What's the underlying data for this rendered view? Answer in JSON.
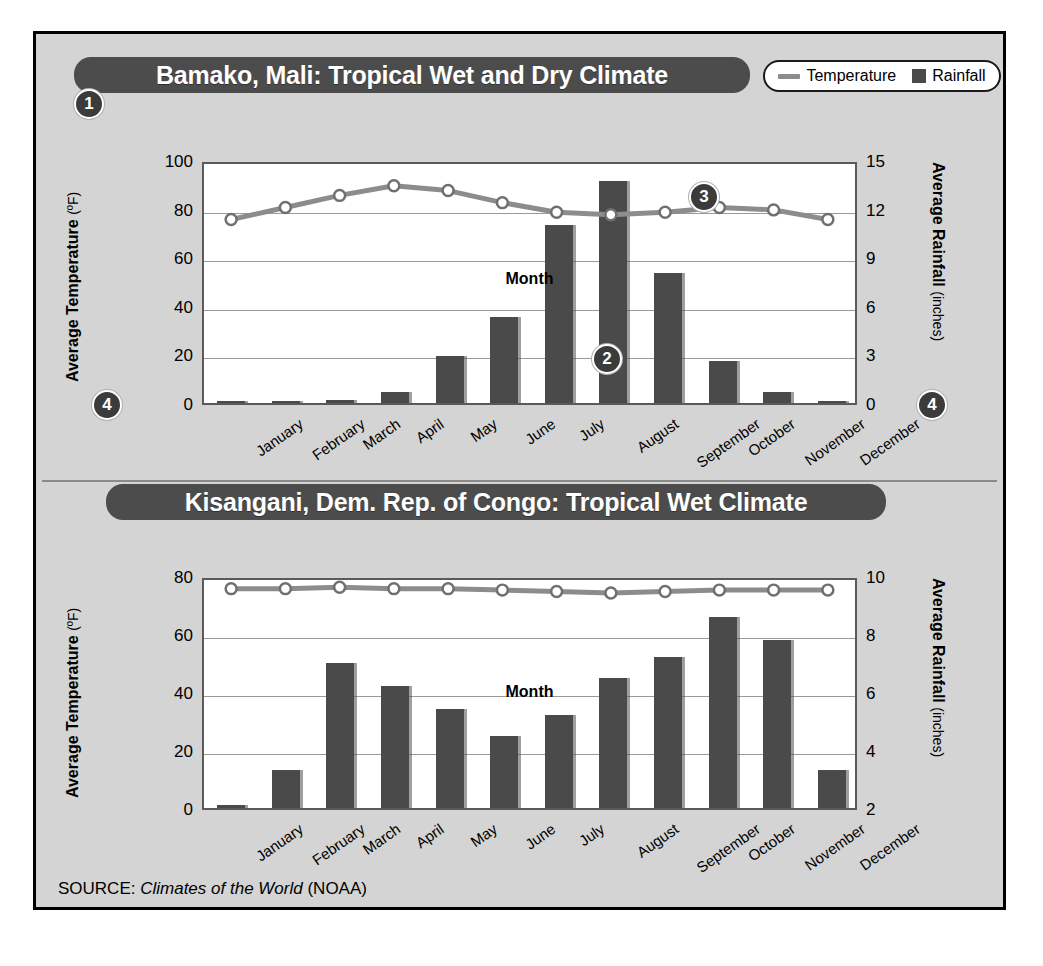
{
  "figure": {
    "source_prefix": "SOURCE:",
    "source_title": "Climates of the World",
    "source_suffix": "(NOAA)"
  },
  "legend": {
    "temperature_label": "Temperature",
    "rainfall_label": "Rainfall",
    "line_color": "#8c8c8c",
    "bar_color": "#4a4a4a"
  },
  "callouts": {
    "one": "1",
    "two": "2",
    "three": "3",
    "four_left": "4",
    "four_right": "4"
  },
  "charts": [
    {
      "title": "Bamako, Mali: Tropical Wet and Dry Climate",
      "x_axis_title": "Month",
      "y_left_title": "Average Temperature",
      "y_left_unit": "(ºF)",
      "y_right_title": "Average Rainfall",
      "y_right_unit": "(inches)",
      "y_left_ticks": [
        "100",
        "80",
        "60",
        "40",
        "20",
        "0"
      ],
      "y_right_ticks": [
        "15",
        "12",
        "9",
        "6",
        "3",
        "0"
      ]
    },
    {
      "title": "Kisangani, Dem. Rep. of Congo: Tropical Wet Climate",
      "x_axis_title": "Month",
      "y_left_title": "Average Temperature",
      "y_left_unit": "(ºF)",
      "y_right_title": "Average Rainfall",
      "y_right_unit": "(inches)",
      "y_left_ticks": [
        "80",
        "60",
        "40",
        "20",
        "0"
      ],
      "y_right_ticks": [
        "10",
        "8",
        "6",
        "4",
        "2"
      ]
    }
  ],
  "chart_data": [
    {
      "type": "bar",
      "title": "Bamako, Mali: Tropical Wet and Dry Climate",
      "xlabel": "Month",
      "ylabel": "Average Temperature (ºF)",
      "y2label": "Average Rainfall (inches)",
      "categories": [
        "January",
        "February",
        "March",
        "April",
        "May",
        "June",
        "July",
        "August",
        "September",
        "October",
        "November",
        "December"
      ],
      "ylim": [
        0,
        100
      ],
      "y2lim": [
        0,
        15
      ],
      "yticks": [
        0,
        20,
        40,
        60,
        80,
        100
      ],
      "y2ticks": [
        0,
        3,
        6,
        9,
        12,
        15
      ],
      "grid": true,
      "legend_position": "top-right",
      "series": [
        {
          "name": "Rainfall",
          "type": "bar",
          "axis": "right",
          "unit": "inches",
          "values": [
            0.1,
            0.1,
            0.2,
            0.7,
            2.9,
            5.3,
            11.0,
            13.7,
            8.0,
            2.6,
            0.7,
            0.1
          ]
        },
        {
          "name": "Temperature",
          "type": "line",
          "axis": "left",
          "unit": "ºF",
          "values": [
            77,
            82,
            87,
            91,
            89,
            84,
            80,
            79,
            80,
            82,
            81,
            77
          ]
        }
      ]
    },
    {
      "type": "bar",
      "title": "Kisangani, Dem. Rep. of Congo: Tropical Wet Climate",
      "xlabel": "Month",
      "ylabel": "Average Temperature (ºF)",
      "y2label": "Average Rainfall (inches)",
      "categories": [
        "January",
        "February",
        "March",
        "April",
        "May",
        "June",
        "July",
        "August",
        "September",
        "October",
        "November",
        "December"
      ],
      "ylim": [
        0,
        80
      ],
      "y2lim": [
        2,
        10
      ],
      "yticks": [
        0,
        20,
        40,
        60,
        80
      ],
      "y2ticks": [
        2,
        4,
        6,
        8,
        10
      ],
      "grid": true,
      "legend_position": "top-right",
      "series": [
        {
          "name": "Rainfall",
          "type": "bar",
          "axis": "right",
          "unit": "inches",
          "values": [
            2.1,
            3.3,
            7.0,
            6.2,
            5.4,
            4.5,
            5.2,
            6.5,
            7.2,
            8.6,
            7.8,
            3.3
          ]
        },
        {
          "name": "Temperature",
          "type": "line",
          "axis": "left",
          "unit": "ºF",
          "values": [
            77,
            77,
            77.5,
            77,
            77,
            76.5,
            76,
            75.5,
            76,
            76.5,
            76.5,
            76.5
          ]
        }
      ]
    }
  ]
}
